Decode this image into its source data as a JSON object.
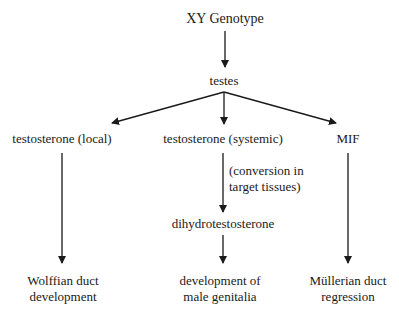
{
  "diagram": {
    "nodes": {
      "genotype": "XY Genotype",
      "testes": "testes",
      "testosterone_local": "testosterone (local)",
      "testosterone_systemic": "testosterone (systemic)",
      "mif": "MIF",
      "conversion_note_line1": "(conversion in",
      "conversion_note_line2": "target tissues)",
      "dht": "dihydrotestosterone",
      "wolffian_line1": "Wolffian duct",
      "wolffian_line2": "development",
      "genitalia_line1": "development of",
      "genitalia_line2": "male genitalia",
      "mullerian_line1": "Müllerian duct",
      "mullerian_line2": "regression"
    },
    "edges": [
      {
        "from": "XY Genotype",
        "to": "testes"
      },
      {
        "from": "testes",
        "to": "testosterone (local)"
      },
      {
        "from": "testes",
        "to": "testosterone (systemic)"
      },
      {
        "from": "testes",
        "to": "MIF"
      },
      {
        "from": "testosterone (local)",
        "to": "Wolffian duct development"
      },
      {
        "from": "testosterone (systemic)",
        "to": "dihydrotestosterone",
        "label": "(conversion in target tissues)"
      },
      {
        "from": "dihydrotestosterone",
        "to": "development of male genitalia"
      },
      {
        "from": "MIF",
        "to": "Müllerian duct regression"
      }
    ]
  }
}
